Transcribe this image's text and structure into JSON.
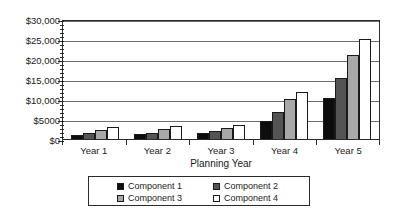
{
  "chart_data": {
    "type": "bar",
    "title": "",
    "subtitle": "",
    "xlabel": "Planning Year",
    "ylabel": "",
    "categories": [
      "Year 1",
      "Year 2",
      "Year 3",
      "Year 4",
      "Year 5"
    ],
    "series": [
      {
        "name": "Component 1",
        "color": "#0d0d0d",
        "values": [
          1000,
          1200,
          1400,
          4600,
          10300
        ]
      },
      {
        "name": "Component 2",
        "color": "#545454",
        "values": [
          1400,
          1600,
          1900,
          6700,
          15200
        ]
      },
      {
        "name": "Component 3",
        "color": "#a8a8a8",
        "values": [
          2300,
          2500,
          2800,
          9900,
          20900
        ]
      },
      {
        "name": "Component 4",
        "color": "#ffffff",
        "values": [
          3100,
          3300,
          3500,
          11800,
          25000
        ]
      }
    ],
    "ylim": [
      0,
      30000
    ],
    "ytick_values": [
      0,
      5000,
      10000,
      15000,
      20000,
      25000,
      30000
    ],
    "ytick_labels": [
      "$0",
      "$5000",
      "$10,000",
      "$15,000",
      "$20,000",
      "$25,000",
      "$30,000"
    ],
    "minor_ticks_per_interval": 5,
    "grid": true,
    "grid_axis": "y",
    "legend_position": "bottom",
    "legend_entries": [
      "Component 1",
      "Component 2",
      "Component 3",
      "Component 4"
    ]
  },
  "axes": {
    "y_axis_name": "dollar-axis",
    "x_axis_name": "planning-year-axis"
  },
  "colors": {
    "axis": "#2b2b2b",
    "gridline": "#6e6e6e",
    "background": "#ffffff",
    "text": "#1a1a1a"
  }
}
